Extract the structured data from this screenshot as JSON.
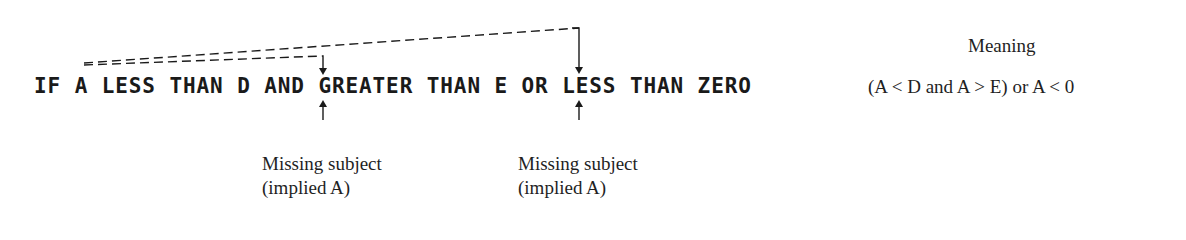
{
  "statement": {
    "text": "IF A LESS THAN D AND GREATER THAN E OR LESS THAN ZERO"
  },
  "meaning": {
    "title": "Meaning",
    "expression": "(A < D and A > E) or A < 0"
  },
  "annotations": [
    {
      "label_line1": "Missing subject",
      "label_line2": "(implied A)",
      "points_after": "AND"
    },
    {
      "label_line1": "Missing subject",
      "label_line2": "(implied A)",
      "points_after": "OR"
    }
  ],
  "colors": {
    "ink": "#1a1a1a",
    "background": "#ffffff"
  }
}
